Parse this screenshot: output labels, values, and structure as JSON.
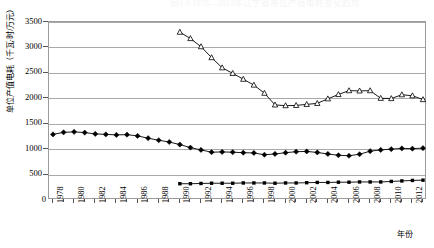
{
  "title": "图4-3  1978—2013年辽宁省单位产值电耗变化趋势",
  "axes": {
    "y_title": "单位产值电耗（千瓦·时/万元）",
    "x_title": "年份",
    "y_ticks": [
      0,
      500,
      1000,
      1500,
      2000,
      2500,
      3000,
      3500
    ],
    "y_tick_labels": [
      "0",
      "500",
      "1000",
      "1500",
      "2000",
      "2500",
      "3000",
      "3500"
    ],
    "x_tick_labels": [
      "1978",
      "1980",
      "1982",
      "1984",
      "1986",
      "1988",
      "1990",
      "1992",
      "1994",
      "1996",
      "1998",
      "2000",
      "2002",
      "2004",
      "2006",
      "2008",
      "2010",
      "2012"
    ]
  },
  "chart_data": {
    "type": "line",
    "title": "图4-3  1978—2013年辽宁省单位产值电耗变化趋势",
    "xlabel": "年份",
    "ylabel": "单位产值电耗（千瓦·时/万元）",
    "ylim": [
      0,
      3500
    ],
    "xlim": [
      1978,
      2013
    ],
    "grid": true,
    "legend": "none",
    "x": [
      1978,
      1979,
      1980,
      1981,
      1982,
      1983,
      1984,
      1985,
      1986,
      1987,
      1988,
      1989,
      1990,
      1991,
      1992,
      1993,
      1994,
      1995,
      1996,
      1997,
      1998,
      1999,
      2000,
      2001,
      2002,
      2003,
      2004,
      2005,
      2006,
      2007,
      2008,
      2009,
      2010,
      2011,
      2012,
      2013
    ],
    "series": [
      {
        "name": "系列1",
        "marker": "diamond",
        "x": [
          1978,
          1979,
          1980,
          1981,
          1982,
          1983,
          1984,
          1985,
          1986,
          1987,
          1988,
          1989,
          1990,
          1991,
          1992,
          1993,
          1994,
          1995,
          1996,
          1997,
          1998,
          1999,
          2000,
          2001,
          2002,
          2003,
          2004,
          2005,
          2006,
          2007,
          2008,
          2009,
          2010,
          2011,
          2012,
          2013
        ],
        "values": [
          1290,
          1330,
          1340,
          1325,
          1300,
          1290,
          1280,
          1285,
          1260,
          1215,
          1175,
          1140,
          1090,
          1030,
          985,
          940,
          945,
          940,
          930,
          925,
          890,
          905,
          930,
          950,
          955,
          935,
          905,
          880,
          870,
          900,
          960,
          985,
          1000,
          1015,
          1010,
          1020
        ]
      },
      {
        "name": "系列2",
        "marker": "triangle",
        "x": [
          1990,
          1991,
          1992,
          1993,
          1994,
          1995,
          1996,
          1997,
          1998,
          1999,
          2000,
          2001,
          2002,
          2003,
          2004,
          2005,
          2006,
          2007,
          2008,
          2009,
          2010,
          2011,
          2012,
          2013
        ],
        "values": [
          3300,
          3175,
          3015,
          2800,
          2600,
          2490,
          2375,
          2260,
          2100,
          1870,
          1855,
          1860,
          1880,
          1900,
          1990,
          2075,
          2150,
          2145,
          2150,
          2000,
          1995,
          2070,
          2050,
          1975
        ]
      },
      {
        "name": "系列3",
        "marker": "square",
        "x": [
          1990,
          1991,
          1992,
          1993,
          1994,
          1995,
          1996,
          1997,
          1998,
          1999,
          2000,
          2001,
          2002,
          2003,
          2004,
          2005,
          2006,
          2007,
          2008,
          2009,
          2010,
          2011,
          2012,
          2013
        ],
        "values": [
          320,
          320,
          325,
          330,
          330,
          330,
          335,
          335,
          335,
          330,
          335,
          335,
          340,
          345,
          345,
          350,
          350,
          355,
          355,
          355,
          365,
          375,
          385,
          390
        ]
      }
    ]
  }
}
